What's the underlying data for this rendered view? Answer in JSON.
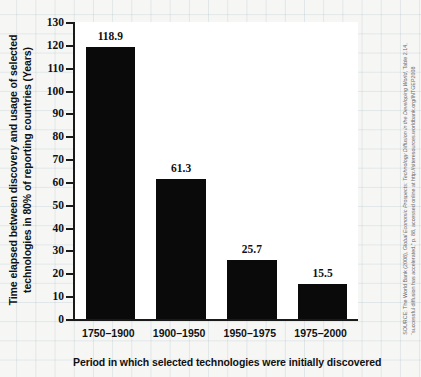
{
  "chart_data": {
    "type": "bar",
    "title": "",
    "categories": [
      "1750–1900",
      "1900–1950",
      "1950–1975",
      "1975–2000"
    ],
    "values": [
      118.9,
      61.3,
      25.7,
      15.5
    ],
    "value_labels": [
      "118.9",
      "61.3",
      "25.7",
      "15.5"
    ],
    "xlabel": "Period in which selected technologies were initially discovered",
    "ylabel": "Time elapsed between discovery and usage of selected technologies in 80% of reporting countries (Years)",
    "ylabel_line1": "Time elapsed between discovery and usage of selected",
    "ylabel_line2": "technologies in 80% of reporting countries (Years)",
    "ylim": [
      0,
      130
    ],
    "ytick_step": 10,
    "ytick_labels": [
      "0",
      "10",
      "20",
      "30",
      "40",
      "50",
      "60",
      "70",
      "80",
      "90",
      "100",
      "110",
      "120",
      "130"
    ],
    "grid": false,
    "background_grid": "graph-paper",
    "legend": null,
    "bar_color": "#0a0a0a",
    "axis_color": "#1a1a1a",
    "plot_background": "#ffffff",
    "page_background": "#f6f7f5"
  },
  "source": {
    "line1_prefix": "SOURCE: The World Bank (2008), ",
    "line1_italic": "Global Economic Prospects: Technology Diffusion in the Developing World",
    "line1_suffix": ", Table 2.14,",
    "line2": "“successful diffusion has accelerated,” p. 88, accessed online at http://siteresources.worldbank.org/INTGEP2008"
  }
}
